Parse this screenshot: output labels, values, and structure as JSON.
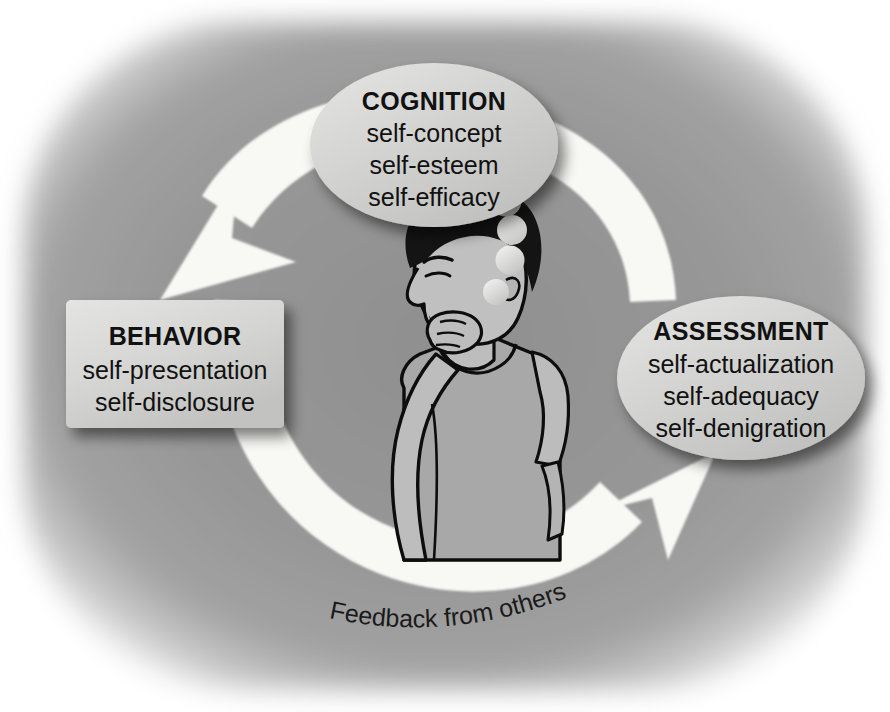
{
  "diagram": {
    "title_hidden": "Self-concept cycle diagram",
    "background_color": "#9a9a9a",
    "arrow_color": "#f7f7f4",
    "text_color": "#111111",
    "node_fill": "#cfcfcf"
  },
  "nodes": {
    "cognition": {
      "shape": "ellipse",
      "title": "COGNITION",
      "lines": [
        "self-concept",
        "self-esteem",
        "self-efficacy"
      ]
    },
    "behavior": {
      "shape": "rounded-rectangle",
      "title": "BEHAVIOR",
      "lines": [
        "self-presentation",
        "self-disclosure"
      ]
    },
    "assessment": {
      "shape": "ellipse",
      "title": "ASSESSMENT",
      "lines": [
        "self-actualization",
        "self-adequacy",
        "self-denigration"
      ]
    }
  },
  "caption": {
    "feedback_label": "Feedback from others"
  },
  "figure": {
    "hair_color": "#141414",
    "skin_color": "#b8b8b8",
    "shirt_color": "#a6a6a6"
  },
  "thought_bubbles": {
    "count": 4
  },
  "arrows": [
    {
      "name": "cognition-to-behavior",
      "direction": "down-left"
    },
    {
      "name": "behavior-to-assessment",
      "direction": "up-right"
    }
  ]
}
